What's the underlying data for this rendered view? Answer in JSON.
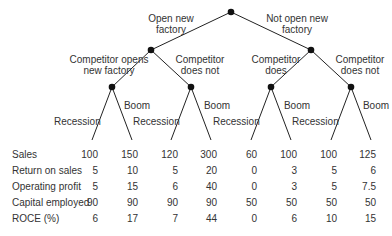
{
  "tree": {
    "level1": [
      {
        "label_line1": "Open new",
        "label_line2": "factory"
      },
      {
        "label_line1": "Not open new",
        "label_line2": "factory"
      }
    ],
    "level2": [
      {
        "label_line1": "Competitor opens",
        "label_line2": "new factory"
      },
      {
        "label_line1": "Competitor",
        "label_line2": "does not"
      },
      {
        "label_line1": "Competitor",
        "label_line2": "does"
      },
      {
        "label_line1": "Competitor",
        "label_line2": "does not"
      }
    ],
    "leaf_labels": {
      "left": "Recession",
      "right": "Boom"
    }
  },
  "table": {
    "rows": [
      {
        "label": "Sales",
        "values": [
          "100",
          "150",
          "120",
          "300",
          "60",
          "100",
          "100",
          "125"
        ]
      },
      {
        "label": "Return on sales",
        "values": [
          "5",
          "10",
          "5",
          "20",
          "0",
          "3",
          "5",
          "6"
        ]
      },
      {
        "label": "Operating profit",
        "values": [
          "5",
          "15",
          "6",
          "40",
          "0",
          "3",
          "5",
          "7.5"
        ]
      },
      {
        "label": "Capital employed",
        "values": [
          "90",
          "90",
          "90",
          "90",
          "50",
          "50",
          "50",
          "50"
        ]
      },
      {
        "label": "ROCE (%)",
        "values": [
          "6",
          "17",
          "7",
          "44",
          "0",
          "6",
          "10",
          "15"
        ]
      }
    ]
  }
}
